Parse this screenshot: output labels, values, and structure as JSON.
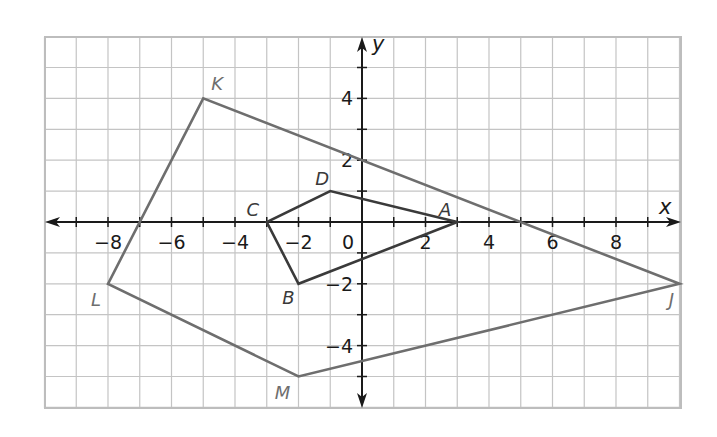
{
  "diagram": {
    "type": "coordinate-plane",
    "x_axis": {
      "label": "x",
      "range": [
        -10,
        10
      ],
      "tick_step": 1,
      "label_step": 2,
      "tick_labels": [
        "−8",
        "−6",
        "−4",
        "−2",
        "2",
        "4",
        "6",
        "8"
      ],
      "tick_values": [
        -8,
        -6,
        -4,
        -2,
        2,
        4,
        6,
        8
      ]
    },
    "y_axis": {
      "label": "y",
      "range": [
        -6,
        6
      ],
      "tick_step": 1,
      "label_step": 2,
      "tick_labels": [
        "4",
        "2",
        "−2",
        "−4"
      ],
      "tick_values": [
        4,
        2,
        -2,
        -4
      ]
    },
    "origin_label": "0",
    "colors": {
      "grid": "#c4c4c4",
      "axis": "#1a1a1a",
      "small_polygon": "#3a3a3a",
      "large_polygon": "#6e6e6e",
      "small_label": "#3a3a3a",
      "large_label": "#6e6e6e"
    },
    "polygons": [
      {
        "name": "ABCD",
        "role": "small",
        "vertices": [
          {
            "label": "A",
            "x": 3,
            "y": 0,
            "label_pos": "above-left"
          },
          {
            "label": "B",
            "x": -2,
            "y": -2,
            "label_pos": "below-left"
          },
          {
            "label": "C",
            "x": -3,
            "y": 0,
            "label_pos": "above-left"
          },
          {
            "label": "D",
            "x": -1,
            "y": 1,
            "label_pos": "above-left"
          }
        ],
        "edges": [
          [
            "A",
            "D"
          ],
          [
            "D",
            "C"
          ],
          [
            "C",
            "B"
          ],
          [
            "B",
            "A"
          ]
        ]
      },
      {
        "name": "JKLM",
        "role": "large",
        "vertices": [
          {
            "label": "J",
            "x": 10,
            "y": -2,
            "label_pos": "below-left"
          },
          {
            "label": "K",
            "x": -5,
            "y": 4,
            "label_pos": "above-right"
          },
          {
            "label": "L",
            "x": -8,
            "y": -2,
            "label_pos": "below-left"
          },
          {
            "label": "M",
            "x": -2,
            "y": -5,
            "label_pos": "below-left"
          }
        ],
        "edges": [
          [
            "J",
            "K"
          ],
          [
            "K",
            "L"
          ],
          [
            "L",
            "M"
          ],
          [
            "M",
            "J"
          ]
        ]
      }
    ]
  }
}
